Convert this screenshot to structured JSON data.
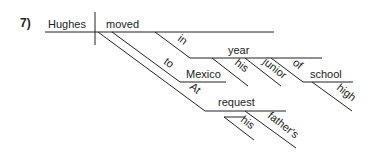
{
  "diagram": {
    "number": "7)",
    "type": "sentence-diagram",
    "subject": "Hughes",
    "verb": "moved",
    "modifiers": {
      "in": "in",
      "year": "year",
      "his1": "his",
      "junior": "junior",
      "of": "of",
      "school": "school",
      "high": "high",
      "to": "to",
      "mexico": "Mexico",
      "at": "At",
      "request": "request",
      "his2": "his",
      "fathers": "father's"
    }
  }
}
